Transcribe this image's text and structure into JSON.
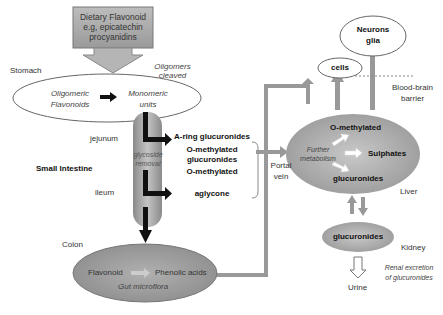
{
  "source": {
    "lines": [
      "Dietary Flavonoid",
      "e.g, epicatechin",
      "procyanidins"
    ]
  },
  "stomach": {
    "label": "Stomach",
    "note": [
      "Oligomers",
      "cleaved"
    ],
    "from": [
      "Oligomeric",
      "Flavonoids"
    ],
    "to": [
      "Monomeric",
      "units"
    ]
  },
  "small_intestine": {
    "label": "Small Intestine",
    "jejunum": "jejunum",
    "ileum": "ileum",
    "tube_label": [
      "glycoside",
      "removal"
    ],
    "products": [
      [
        "A-ring glucuronides"
      ],
      [
        "O-methylated",
        "glucuronides"
      ],
      [
        "O-methylated"
      ],
      [
        "aglycone"
      ]
    ]
  },
  "portal": [
    "Portal",
    "vein"
  ],
  "colon": {
    "label": "Colon",
    "from": "Flavonoid",
    "to": "Phenolic acids",
    "note": "Gut microflora"
  },
  "liver": {
    "label": "Liver",
    "center": [
      "Further",
      "metabolism"
    ],
    "products": [
      "O-methylated",
      "Sulphates",
      "glucuronides"
    ]
  },
  "targets": {
    "cells": "cells",
    "neurons": [
      "Neurons",
      "glia"
    ],
    "bbb": [
      "Blood-brain",
      "barrier"
    ]
  },
  "kidney": {
    "label": "Kidney",
    "inner": "glucuronides",
    "note": [
      "Renal excretion",
      "of glucuronides"
    ],
    "output": "Urine"
  },
  "colors": {
    "box_fill": "#a8a8a8",
    "ellipse_fill": "#a3a3a3",
    "arrow_gray": "#999999",
    "arrow_black": "#111111"
  }
}
